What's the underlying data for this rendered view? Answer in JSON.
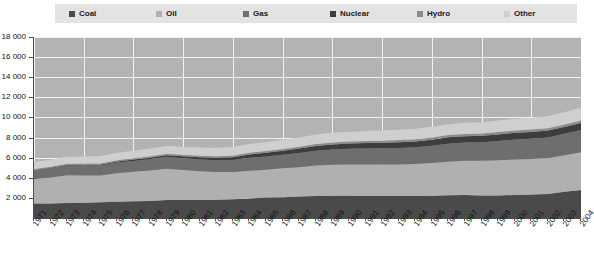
{
  "chart_data": {
    "type": "area",
    "title": "",
    "subtitle": "",
    "xlabel": "",
    "ylabel": "",
    "stacked": true,
    "grid": true,
    "legend_position": "top",
    "xlim": [
      1971,
      2004
    ],
    "ylim": [
      0,
      18000
    ],
    "ytick_step": 2000,
    "yticks": [
      "18 000",
      "16 000",
      "14 000",
      "12 000",
      "10 000",
      "8 000",
      "6 000",
      "4 000",
      "2 000"
    ],
    "ytick_values": [
      18000,
      16000,
      14000,
      12000,
      10000,
      8000,
      6000,
      4000,
      2000
    ],
    "x": [
      1971,
      1972,
      1973,
      1974,
      1975,
      1976,
      1977,
      1978,
      1979,
      1980,
      1981,
      1982,
      1983,
      1984,
      1985,
      1986,
      1987,
      1988,
      1989,
      1990,
      1991,
      1992,
      1993,
      1994,
      1995,
      1996,
      1997,
      1998,
      1999,
      2000,
      2001,
      2002,
      2003,
      2004
    ],
    "categories": [
      "1971",
      "1972",
      "1973",
      "1974",
      "1975",
      "1976",
      "1977",
      "1978",
      "1979",
      "1980",
      "1981",
      "1982",
      "1983",
      "1984",
      "1985",
      "1986",
      "1987",
      "1988",
      "1989",
      "1990",
      "1991",
      "1992",
      "1993",
      "1994",
      "1995",
      "1996",
      "1997",
      "1998",
      "1999",
      "2000",
      "2001",
      "2002",
      "2003",
      "2004"
    ],
    "series": [
      {
        "name": "Coal",
        "color": "#4a4a4a",
        "values": [
          1440,
          1450,
          1500,
          1520,
          1560,
          1620,
          1670,
          1700,
          1790,
          1800,
          1790,
          1810,
          1860,
          1950,
          2030,
          2070,
          2130,
          2190,
          2220,
          2220,
          2200,
          2180,
          2180,
          2180,
          2220,
          2270,
          2290,
          2250,
          2250,
          2290,
          2330,
          2390,
          2600,
          2780
        ]
      },
      {
        "name": "Oil",
        "color": "#b0b0b0",
        "values": [
          2420,
          2570,
          2760,
          2710,
          2660,
          2840,
          2930,
          3030,
          3110,
          2970,
          2850,
          2760,
          2720,
          2760,
          2760,
          2870,
          2920,
          3020,
          3070,
          3100,
          3110,
          3150,
          3140,
          3200,
          3250,
          3320,
          3410,
          3440,
          3500,
          3530,
          3540,
          3560,
          3640,
          3760
        ]
      },
      {
        "name": "Gas",
        "color": "#6e6e6e",
        "values": [
          890,
          930,
          970,
          990,
          990,
          1050,
          1070,
          1110,
          1180,
          1180,
          1180,
          1180,
          1200,
          1280,
          1320,
          1340,
          1410,
          1470,
          1530,
          1560,
          1600,
          1600,
          1640,
          1650,
          1710,
          1800,
          1810,
          1840,
          1900,
          1980,
          2010,
          2060,
          2130,
          2200
        ]
      },
      {
        "name": "Nuclear",
        "color": "#3d3d3d",
        "values": [
          29,
          39,
          51,
          68,
          93,
          110,
          140,
          160,
          170,
          190,
          220,
          240,
          270,
          330,
          380,
          410,
          450,
          490,
          500,
          530,
          550,
          560,
          580,
          590,
          610,
          630,
          620,
          640,
          660,
          670,
          680,
          690,
          680,
          710
        ]
      },
      {
        "name": "Hydro",
        "color": "#8c8c8c",
        "values": [
          104,
          108,
          110,
          120,
          123,
          124,
          129,
          137,
          142,
          147,
          151,
          156,
          164,
          170,
          175,
          181,
          183,
          190,
          190,
          193,
          199,
          199,
          208,
          209,
          217,
          224,
          226,
          228,
          231,
          233,
          231,
          233,
          236,
          243
        ]
      },
      {
        "name": "Other",
        "color": "#cfcfcf",
        "values": [
          690,
          700,
          710,
          720,
          730,
          740,
          750,
          770,
          780,
          800,
          810,
          830,
          850,
          870,
          890,
          900,
          920,
          940,
          960,
          980,
          1000,
          1010,
          1030,
          1050,
          1070,
          1090,
          1110,
          1130,
          1150,
          1170,
          1190,
          1210,
          1240,
          1270
        ]
      }
    ]
  },
  "legend": {
    "items": [
      {
        "label": "Coal",
        "color": "#4a4a4a"
      },
      {
        "label": "Oil",
        "color": "#b0b0b0"
      },
      {
        "label": "Gas",
        "color": "#6e6e6e"
      },
      {
        "label": "Nuclear",
        "color": "#3d3d3d"
      },
      {
        "label": "Hydro",
        "color": "#8c8c8c"
      },
      {
        "label": "Other",
        "color": "#cfcfcf"
      }
    ],
    "background": "#e3e3e3"
  },
  "colors": {
    "plot_background": "#b3b3b3",
    "gridline": "#f2f2f2",
    "axis": "#4d4d4d",
    "text": "#111111",
    "page_background": "#ffffff"
  }
}
